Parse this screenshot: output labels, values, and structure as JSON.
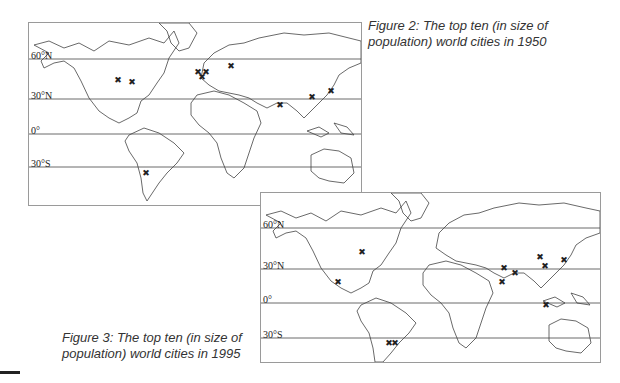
{
  "figures": [
    {
      "id": "fig2",
      "caption_line1": "Figure 2: The top ten (in size of",
      "caption_line2": "population) world cities in 1950",
      "year": "1950",
      "latitude_labels": [
        "60°N",
        "30°N",
        "0°",
        "30°S"
      ],
      "city_markers": [
        {
          "region": "North America (Chicago)",
          "x": 89,
          "y": 57
        },
        {
          "region": "North America (New York)",
          "x": 103,
          "y": 59
        },
        {
          "region": "Europe (London)",
          "x": 169,
          "y": 49
        },
        {
          "region": "Europe (Paris)",
          "x": 173,
          "y": 54
        },
        {
          "region": "Europe (Berlin)",
          "x": 177,
          "y": 49
        },
        {
          "region": "Europe (Moscow)",
          "x": 202,
          "y": 43
        },
        {
          "region": "Asia (Calcutta)",
          "x": 251,
          "y": 82
        },
        {
          "region": "Asia (Shanghai)",
          "x": 283,
          "y": 74
        },
        {
          "region": "Asia (Tokyo)",
          "x": 302,
          "y": 68
        },
        {
          "region": "South America (Buenos Aires)",
          "x": 117,
          "y": 150
        }
      ]
    },
    {
      "id": "fig3",
      "caption_line1": "Figure 3: The top ten (in size of",
      "caption_line2": "population) world cities in 1995",
      "year": "1995",
      "latitude_labels": [
        "60°N",
        "30°N",
        "0°",
        "30°S"
      ],
      "city_markers": [
        {
          "region": "North America (New York)",
          "x": 101,
          "y": 59
        },
        {
          "region": "North America (Mexico City)",
          "x": 77,
          "y": 89
        },
        {
          "region": "South America (São Paulo / Rio)",
          "x": 130,
          "y": 70
        },
        {
          "region": "Asia (Karachi)",
          "x": 243,
          "y": 75
        },
        {
          "region": "Asia (Calcutta)",
          "x": 254,
          "y": 80
        },
        {
          "region": "Asia (Bombay)",
          "x": 241,
          "y": 89
        },
        {
          "region": "Asia (Beijing)",
          "x": 279,
          "y": 64
        },
        {
          "region": "Asia (Shanghai)",
          "x": 284,
          "y": 73
        },
        {
          "region": "Asia (Tokyo)",
          "x": 303,
          "y": 67
        },
        {
          "region": "Asia (Jakarta)",
          "x": 285,
          "y": 112
        }
      ]
    }
  ]
}
